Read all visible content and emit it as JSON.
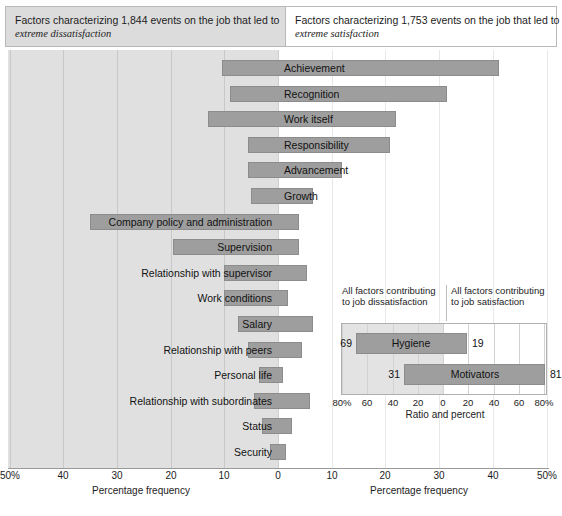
{
  "header": {
    "left": {
      "line1": "Factors characterizing 1,844 events on the job that led to",
      "line2": "extreme dissatisfaction"
    },
    "right": {
      "line1": "Factors characterizing 1,753 events on the job that led to",
      "line2": "extreme satisfaction"
    }
  },
  "axis": {
    "left_title": "Percentage frequency",
    "right_title": "Percentage frequency",
    "ticks": [
      "50%",
      "40",
      "30",
      "20",
      "10",
      "0",
      "10",
      "20",
      "30",
      "40",
      "50%"
    ],
    "range": [
      50,
      50
    ],
    "zero_label": "0"
  },
  "colors": {
    "bar_fill": "#9e9e9e",
    "bar_stroke": "#8c8c8c",
    "shade": "#e0e0e0",
    "grid": "#c8c8c8",
    "text": "#1a1a1a"
  },
  "chart_data": {
    "type": "bar",
    "orientation": "horizontal-diverging",
    "xlabel": "Percentage frequency",
    "ylabel": "",
    "xlim": [
      -50,
      50
    ],
    "grid": true,
    "legend": "none",
    "left_side": "extreme dissatisfaction",
    "right_side": "extreme satisfaction",
    "categories": [
      "Achievement",
      "Recognition",
      "Work itself",
      "Responsibility",
      "Advancement",
      "Growth",
      "Company policy and administration",
      "Supervision",
      "Relationship with supervisor",
      "Work conditions",
      "Salary",
      "Relationship with peers",
      "Personal life",
      "Relationship with subordinates",
      "Status",
      "Security"
    ],
    "series": [
      {
        "name": "Dissatisfaction (left of zero, %)",
        "values": [
          10.5,
          9.0,
          13.0,
          5.5,
          5.5,
          5.0,
          35.0,
          19.5,
          10.0,
          10.0,
          7.5,
          5.5,
          3.5,
          4.5,
          3.0,
          1.5
        ]
      },
      {
        "name": "Satisfaction (right of zero, %)",
        "values": [
          41.0,
          31.5,
          22.0,
          21.0,
          12.0,
          6.5,
          4.0,
          4.0,
          5.5,
          2.0,
          6.5,
          4.5,
          1.0,
          6.0,
          2.5,
          1.5
        ]
      }
    ],
    "label_sides": [
      "right",
      "right",
      "right",
      "right",
      "right",
      "right",
      "left",
      "left",
      "left",
      "left",
      "left",
      "left",
      "left",
      "left",
      "left",
      "left"
    ]
  },
  "inset": {
    "caption_left": "All factors contributing to job dissatisfaction",
    "caption_right": "All factors contributing to job satisfaction",
    "axis_title": "Ratio and percent",
    "ticks": [
      "80%",
      "60",
      "40",
      "20",
      "0",
      "20",
      "40",
      "60",
      "80%"
    ],
    "chart_data": {
      "type": "bar",
      "orientation": "horizontal-diverging",
      "xlabel": "Ratio and percent",
      "xlim": [
        -80,
        80
      ],
      "categories": [
        "Hygiene",
        "Motivators"
      ],
      "series": [
        {
          "name": "Contributing to job dissatisfaction (%)",
          "values": [
            69,
            31
          ]
        },
        {
          "name": "Contributing to job satisfaction (%)",
          "values": [
            19,
            81
          ]
        }
      ],
      "value_labels_left": [
        "69",
        "31"
      ],
      "value_labels_right": [
        "19",
        "81"
      ]
    }
  }
}
